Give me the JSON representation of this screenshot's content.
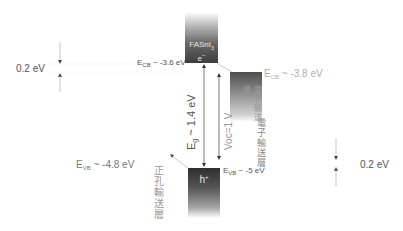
{
  "diagram": {
    "perovskite": {
      "name_main": "FASnI",
      "name_sub": "3",
      "carrier": "e",
      "carrier_sup": "−"
    },
    "etl": {
      "label": "電子輸送層",
      "ecb_prefix": "E",
      "ecb_sub": "CB",
      "ecb_value": " ~ -3.8 eV"
    },
    "htl": {
      "label": "正孔輸送層",
      "carrier": "h",
      "carrier_sup": "+",
      "evb_prefix": "E",
      "evb_sub": "VB",
      "evb_value": " ~ -4.8 eV"
    },
    "perovskite_levels": {
      "ecb_prefix": "E",
      "ecb_sub": "CB",
      "ecb_value": " ~ -3.6 eV",
      "evb_prefix": "E",
      "evb_sub": "VB",
      "evb_value": " ~ -5 eV"
    },
    "bandgap": {
      "prefix": "E",
      "sub": "g",
      "value": " ~ 1.4 eV"
    },
    "voc": {
      "label": "Voc=1 V"
    },
    "offsets": {
      "left": "0.2 eV",
      "right": "0.2 eV"
    },
    "colors": {
      "text": "#555555",
      "light_text": "#b0b0b0",
      "arrow": "#444444",
      "box_dark": "#3c3c3c"
    }
  }
}
